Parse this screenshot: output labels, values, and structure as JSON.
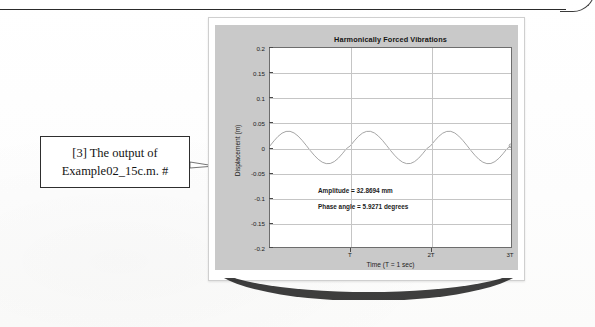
{
  "page": {
    "callout": {
      "line1": "[3] The output of",
      "line2": "Example02_15c.m.  #"
    }
  },
  "figure": {
    "annotations": {
      "amplitude": "Amplitude = 32.8694 mm",
      "phase_angle": "Phase angle = 5.9271 degrees"
    }
  },
  "chart_data": {
    "type": "line",
    "title": "Harmonically Forced Vibrations",
    "xlabel": "Time (T = 1 sec)",
    "ylabel": "Displacement (m)",
    "grid": true,
    "legend": false,
    "xlim": [
      0,
      3
    ],
    "ylim": [
      -0.2,
      0.2
    ],
    "ytick_labels": [
      "0.2",
      "0.15",
      "0.1",
      "0.05",
      "0",
      "-0.05",
      "-0.1",
      "-0.15",
      "-0.2"
    ],
    "ytick_values": [
      0.2,
      0.15,
      0.1,
      0.05,
      0,
      -0.05,
      -0.1,
      -0.15,
      -0.2
    ],
    "xtick_labels": [
      "T",
      "2T",
      "3T"
    ],
    "xtick_values": [
      1,
      2,
      3
    ],
    "amplitude_m": 0.0328694,
    "amplitude_mm": 32.8694,
    "phase_angle_deg": 5.9271,
    "period_T_sec": 1,
    "cycles_shown": 3,
    "line_color": "#9a9a9a",
    "end_marker": "circle",
    "series": [
      {
        "name": "Displacement",
        "x": [
          0,
          0.05,
          0.1,
          0.15,
          0.2,
          0.25,
          0.3,
          0.35,
          0.4,
          0.45,
          0.5,
          0.55,
          0.6,
          0.65,
          0.7,
          0.75,
          0.8,
          0.85,
          0.9,
          0.95,
          1,
          1.05,
          1.1,
          1.15,
          1.2,
          1.25,
          1.3,
          1.35,
          1.4,
          1.45,
          1.5,
          1.55,
          1.6,
          1.65,
          1.7,
          1.75,
          1.8,
          1.85,
          1.9,
          1.95,
          2,
          2.05,
          2.1,
          2.15,
          2.2,
          2.25,
          2.3,
          2.35,
          2.4,
          2.45,
          2.5,
          2.55,
          2.6,
          2.65,
          2.7,
          2.75,
          2.8,
          2.85,
          2.9,
          2.95,
          3
        ],
        "y": [
          0.0034,
          0.0134,
          0.0223,
          0.0288,
          0.0323,
          0.0325,
          0.0292,
          0.0229,
          0.0143,
          0.0044,
          -0.0059,
          -0.0155,
          -0.0237,
          -0.0295,
          -0.0324,
          -0.0321,
          -0.0283,
          -0.0216,
          -0.0126,
          -0.0025,
          0.0034,
          0.0134,
          0.0223,
          0.0288,
          0.0323,
          0.0325,
          0.0292,
          0.0229,
          0.0143,
          0.0044,
          -0.0059,
          -0.0155,
          -0.0237,
          -0.0295,
          -0.0324,
          -0.0321,
          -0.0283,
          -0.0216,
          -0.0126,
          -0.0025,
          0.0034,
          0.0134,
          0.0223,
          0.0288,
          0.0323,
          0.0325,
          0.0292,
          0.0229,
          0.0143,
          0.0044,
          -0.0059,
          -0.0155,
          -0.0237,
          -0.0295,
          -0.0324,
          -0.0321,
          -0.0283,
          -0.0216,
          -0.0126,
          -0.0025,
          0.0034
        ]
      }
    ]
  }
}
